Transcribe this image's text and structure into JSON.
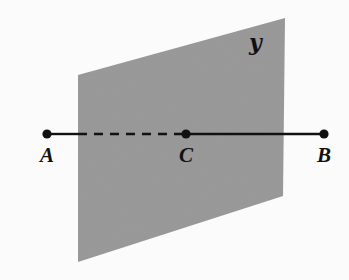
{
  "figure": {
    "kind": "plane-and-line-intersection-diagram",
    "width": 349,
    "height": 280,
    "background_color": "#fbfbfb",
    "plane": {
      "label": "ℬ",
      "label_text": "K",
      "script_label": "𝒚",
      "fill_color": "#9a9a9a",
      "corners": [
        {
          "x": 78,
          "y": 75
        },
        {
          "x": 285,
          "y": 18
        },
        {
          "x": 283,
          "y": 196
        },
        {
          "x": 78,
          "y": 262
        }
      ],
      "label_position": {
        "x": 252,
        "y": 33
      }
    },
    "line": {
      "stroke_color": "#111111",
      "stroke_width": 2.4,
      "y": 134,
      "dash_pattern": "9 7",
      "segments": [
        {
          "name": "segment-a-to-plane",
          "style": "solid",
          "x1": 47,
          "x2": 78
        },
        {
          "name": "segment-plane-to-c",
          "style": "dashed",
          "x1": 78,
          "x2": 186
        },
        {
          "name": "segment-c-to-b",
          "style": "solid",
          "x1": 186,
          "x2": 324
        }
      ]
    },
    "points": [
      {
        "id": "A",
        "label": "A",
        "x": 47,
        "y": 134,
        "radius": 4.6,
        "label_x": 47,
        "label_y": 145
      },
      {
        "id": "C",
        "label": "C",
        "x": 186,
        "y": 134,
        "radius": 4.6,
        "label_x": 186,
        "label_y": 145
      },
      {
        "id": "B",
        "label": "B",
        "x": 324,
        "y": 134,
        "radius": 4.6,
        "label_x": 324,
        "label_y": 145
      }
    ]
  },
  "chart_data": {
    "type": "diagram",
    "title": "",
    "plane_label": "K",
    "point_labels": [
      "A",
      "C",
      "B"
    ],
    "point_coordinates": [
      [
        47,
        134
      ],
      [
        186,
        134
      ],
      [
        324,
        134
      ]
    ],
    "hidden_segment": [
      "A-side-inside-plane",
      "C"
    ],
    "colors": {
      "plane_fill": "#9a9a9a",
      "line": "#111111",
      "background": "#fbfbfb"
    }
  }
}
